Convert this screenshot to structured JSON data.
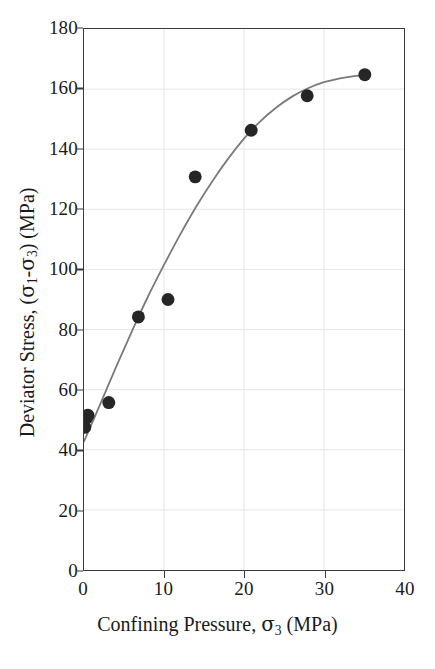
{
  "figure": {
    "background": "#ffffff",
    "frame_color": "#3a3a3a",
    "gridline_color": "#e6e6ec",
    "marker_color": "#262626",
    "curve_color": "#7a7a7a"
  },
  "axes": {
    "x": {
      "title_prefix": "Confining Pressure, ",
      "title_symbol": "σ",
      "title_sub": "3",
      "title_suffix": " (MPa)",
      "title_full": "Confining Pressure, σ3 (MPa)",
      "ticks": [
        0,
        10,
        20,
        30,
        40
      ],
      "tick_labels": [
        "0",
        "10",
        "20",
        "30",
        "40"
      ],
      "min": 0,
      "max": 40
    },
    "y": {
      "title_prefix": "Deviator Stress, (",
      "title_symbol1": "σ",
      "title_sub1": "1",
      "title_dash": "-",
      "title_symbol2": "σ",
      "title_sub2": "3",
      "title_suffix": ") (MPa)",
      "title_full": "Deviator Stress, (σ1-σ3) (MPa)",
      "ticks": [
        0,
        20,
        40,
        60,
        80,
        100,
        120,
        140,
        160,
        180
      ],
      "tick_labels": [
        "0",
        "20",
        "40",
        "60",
        "80",
        "100",
        "120",
        "140",
        "160",
        "180"
      ],
      "min": 0,
      "max": 180
    }
  },
  "chart_data": {
    "type": "scatter",
    "title": "",
    "xlabel": "Confining Pressure, σ3 (MPa)",
    "ylabel": "Deviator Stress, (σ1-σ3) (MPa)",
    "xlim": [
      0,
      40
    ],
    "ylim": [
      0,
      180
    ],
    "xticks": [
      0,
      10,
      20,
      30,
      40
    ],
    "yticks": [
      0,
      20,
      40,
      60,
      80,
      100,
      120,
      140,
      160,
      180
    ],
    "grid": true,
    "legend": null,
    "series": [
      {
        "name": "Measured data",
        "marker": "filled-circle",
        "marker_size_px": 13,
        "color": "#262626",
        "points": [
          {
            "x": 0.1,
            "y": 47.5
          },
          {
            "x": 0.3,
            "y": 50.5
          },
          {
            "x": 0.5,
            "y": 51.5
          },
          {
            "x": 3.1,
            "y": 55.7
          },
          {
            "x": 6.8,
            "y": 84.2
          },
          {
            "x": 10.5,
            "y": 90.0
          },
          {
            "x": 13.9,
            "y": 130.8
          },
          {
            "x": 20.9,
            "y": 146.3
          },
          {
            "x": 27.9,
            "y": 157.8
          },
          {
            "x": 35.1,
            "y": 164.8
          }
        ]
      },
      {
        "name": "Fitted curve",
        "marker": "none",
        "type": "line",
        "color": "#7a7a7a",
        "points": [
          {
            "x": 0.0,
            "y": 42.8
          },
          {
            "x": 2.0,
            "y": 55.0
          },
          {
            "x": 4.0,
            "y": 67.5
          },
          {
            "x": 6.0,
            "y": 79.5
          },
          {
            "x": 8.0,
            "y": 91.0
          },
          {
            "x": 10.0,
            "y": 101.5
          },
          {
            "x": 12.0,
            "y": 111.5
          },
          {
            "x": 14.0,
            "y": 120.8
          },
          {
            "x": 16.0,
            "y": 129.2
          },
          {
            "x": 18.0,
            "y": 136.8
          },
          {
            "x": 20.0,
            "y": 143.5
          },
          {
            "x": 22.0,
            "y": 149.2
          },
          {
            "x": 24.0,
            "y": 153.8
          },
          {
            "x": 26.0,
            "y": 157.5
          },
          {
            "x": 28.0,
            "y": 160.3
          },
          {
            "x": 30.0,
            "y": 162.3
          },
          {
            "x": 32.0,
            "y": 163.6
          },
          {
            "x": 34.0,
            "y": 164.4
          },
          {
            "x": 35.2,
            "y": 164.6
          }
        ]
      }
    ]
  }
}
